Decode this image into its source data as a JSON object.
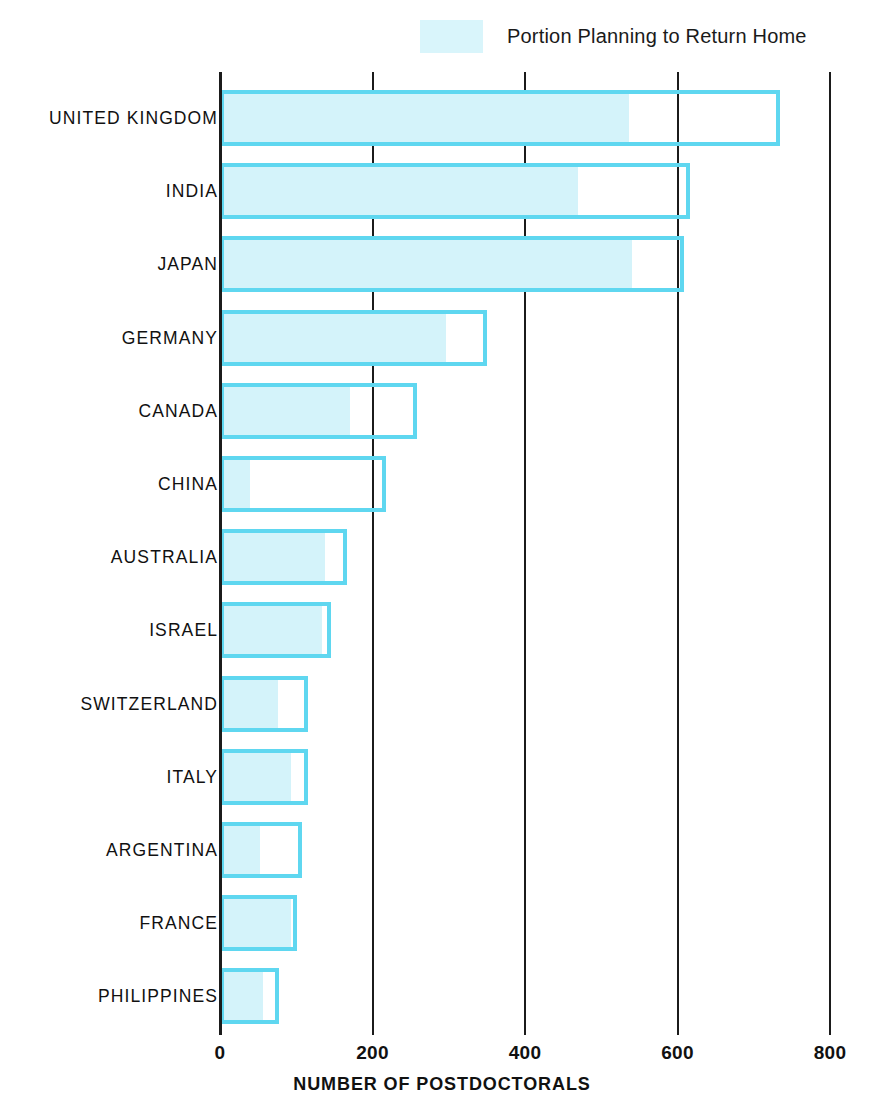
{
  "legend": {
    "icon": "legend-swatch",
    "label": "Portion Planning to Return Home",
    "swatch_color": "#d9f5fb"
  },
  "axis": {
    "x_title": "NUMBER OF POSTDOCTORALS",
    "ticks": [
      "0",
      "200",
      "400",
      "600",
      "800"
    ],
    "tick_values": [
      0,
      200,
      400,
      600,
      800
    ],
    "xlim": [
      0,
      800
    ]
  },
  "colors": {
    "bar_outline": "#5fd7f0",
    "bar_fill": "#d4f3fa",
    "axis": "#1b1b1b",
    "text": "#111111"
  },
  "chart_data": {
    "type": "bar",
    "orientation": "horizontal",
    "title": "",
    "subtitle": "",
    "xlabel": "NUMBER OF POSTDOCTORALS",
    "ylabel": "",
    "xlim": [
      0,
      800
    ],
    "xticks": [
      0,
      200,
      400,
      600,
      800
    ],
    "grid": "vertical gridlines at each x tick",
    "legend": [
      "Portion Planning to Return Home"
    ],
    "legend_position": "top-center",
    "categories": [
      "UNITED KINGDOM",
      "INDIA",
      "JAPAN",
      "GERMANY",
      "CANADA",
      "CHINA",
      "AUSTRALIA",
      "ISRAEL",
      "SWITZERLAND",
      "ITALY",
      "ARGENTINA",
      "FRANCE",
      "PHILIPPINES"
    ],
    "series": [
      {
        "name": "Number of Postdoctorals",
        "values": [
          734,
          617,
          608,
          350,
          259,
          218,
          166,
          146,
          115,
          115,
          108,
          101,
          78
        ]
      },
      {
        "name": "Portion Planning to Return Home",
        "values": [
          537,
          469,
          540,
          297,
          171,
          39,
          138,
          134,
          76,
          93,
          52,
          93,
          56
        ]
      }
    ]
  }
}
